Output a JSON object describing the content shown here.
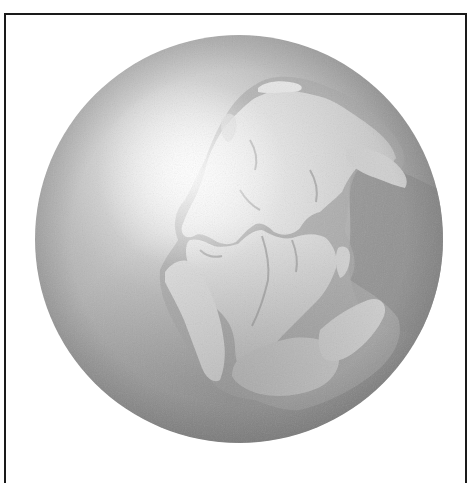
{
  "figure": {
    "frame_color": "#1a1a1a",
    "background_color": "#ffffff"
  },
  "globe": {
    "center": [
      239,
      239
    ],
    "radius": 204,
    "highlight_center": [
      190,
      170
    ],
    "colors": {
      "highlight": "#fbfbfb",
      "ocean_light": "#c8c8c8",
      "ocean_mid": "#a8a8a8",
      "ocean_dark": "#8a8a8a",
      "tethys_sea": "#8f8f8f",
      "land": "#d6d6d6",
      "land_light": "#ececec",
      "coast_shadow": "#9e9e9e"
    }
  },
  "landmasses": [
    {
      "name": "laurasia-north-america",
      "color": "#dedede"
    },
    {
      "name": "laurasia-eurasia",
      "color": "#d2d2d2"
    },
    {
      "name": "gondwana-south-america",
      "color": "#e6e6e6"
    },
    {
      "name": "gondwana-africa",
      "color": "#dcdcdc"
    },
    {
      "name": "gondwana-antarctica",
      "color": "#c4c4c4"
    },
    {
      "name": "gondwana-australia-india",
      "color": "#cbcbcb"
    },
    {
      "name": "greenland-arctic-islands",
      "color": "#e0e0e0"
    }
  ]
}
